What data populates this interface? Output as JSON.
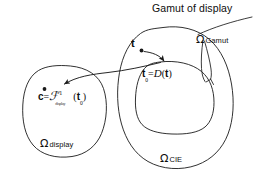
{
  "figure": {
    "title": "Gamut of display",
    "background_color": "#ffffff",
    "stroke_color": "#1a1a1a",
    "labels": {
      "omega_symbol": "Ω",
      "omega_gamut_sub": "Gamut",
      "omega_display_sub": "display",
      "omega_cie_sub": "CIE",
      "vector_t": "t",
      "vector_t0_base": "t",
      "t0_subscript": "0",
      "equals": "=",
      "mapping_d": "D",
      "open_paren": "(",
      "close_paren": ")",
      "vector_c": "c",
      "script_f": "ℱ",
      "inverse_exponent": "-1",
      "f_subscript": "display"
    },
    "regions": [
      {
        "name": "display-gamut-region",
        "label": "Ω display",
        "description": "left closed blob representing device display colour space"
      },
      {
        "name": "cie-region",
        "label": "Ω CIE",
        "description": "large right closed blob representing CIE colour space"
      },
      {
        "name": "gamut-region",
        "label": "Ω Gamut",
        "description": "inner closed blob inside CIE region representing displayable gamut"
      }
    ],
    "points": [
      {
        "name": "point-t",
        "label": "t",
        "description": "source colour outside the display gamut"
      },
      {
        "name": "point-t0",
        "label": "t0 = D(t)",
        "description": "gamut-mapped colour on the gamut boundary"
      },
      {
        "name": "point-c",
        "label": "c = F^-1(t0)",
        "description": "device coordinates obtained by inverse display model"
      }
    ],
    "arrows": [
      {
        "name": "arrow-t-to-t0",
        "from": "point-t",
        "to": "point-t0",
        "description": "gamut mapping D"
      },
      {
        "name": "arrow-t0-to-c",
        "from": "point-t0",
        "to": "point-c",
        "description": "inverse display characterisation"
      },
      {
        "name": "leader-omega-gamut",
        "from": "omega-gamut-label",
        "to": "gamut-region-boundary",
        "description": "leader wedge pointing at the inner gamut boundary"
      }
    ]
  }
}
